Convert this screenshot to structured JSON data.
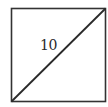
{
  "diagram": {
    "shape": "square",
    "diagonal": "bottom-left to top-right",
    "diagonal_label": "10",
    "stroke_color": "#333333",
    "background": "#ffffff"
  }
}
